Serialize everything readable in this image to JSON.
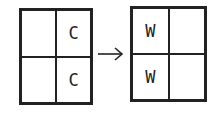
{
  "diagram": {
    "left_grid": {
      "cells": [
        "",
        "C",
        "",
        "C"
      ]
    },
    "arrow": "→",
    "right_grid": {
      "cells": [
        "W",
        "",
        "W",
        ""
      ]
    }
  }
}
